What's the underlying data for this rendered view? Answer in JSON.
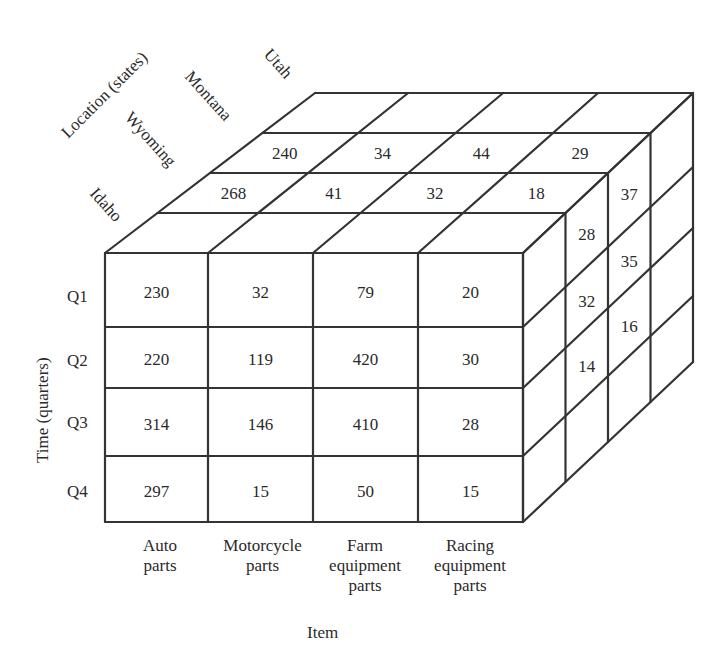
{
  "chart_data": {
    "type": "table",
    "axes": {
      "time": {
        "label": "Time (quarters)",
        "ticks": [
          "Q1",
          "Q2",
          "Q3",
          "Q4"
        ]
      },
      "item": {
        "label": "Item",
        "ticks": [
          "Auto parts",
          "Motorcycle parts",
          "Farm equipment parts",
          "Racing equipment parts"
        ]
      },
      "location": {
        "label": "Location (states)",
        "ticks": [
          "Idaho",
          "Wyoming",
          "Montana",
          "Utah"
        ]
      }
    },
    "front_face_idaho": {
      "rows": [
        "Q1",
        "Q2",
        "Q3",
        "Q4"
      ],
      "columns": [
        "Auto parts",
        "Motorcycle parts",
        "Farm equipment parts",
        "Racing equipment parts"
      ],
      "values": [
        [
          230,
          32,
          79,
          20
        ],
        [
          220,
          119,
          420,
          30
        ],
        [
          314,
          146,
          410,
          28
        ],
        [
          297,
          15,
          50,
          15
        ]
      ]
    },
    "top_face_q1": {
      "Wyoming": [
        268,
        41,
        32,
        18
      ],
      "Montana": [
        240,
        34,
        44,
        29
      ]
    },
    "right_face_racing_equipment": {
      "Wyoming": {
        "Q1": 28,
        "Q2": 32,
        "Q3": 14
      },
      "Montana": {
        "Q1": 37,
        "Q2": 35,
        "Q3": 16
      }
    }
  },
  "labels": {
    "location_title": "Location (states)",
    "states": [
      "Idaho",
      "Wyoming",
      "Montana",
      "Utah"
    ],
    "time_title": "Time (quarters)",
    "quarters": [
      "Q1",
      "Q2",
      "Q3",
      "Q4"
    ],
    "item_title": "Item",
    "items": [
      [
        "Auto",
        "parts"
      ],
      [
        "Motorcycle",
        "parts"
      ],
      [
        "Farm",
        "equipment",
        "parts"
      ],
      [
        "Racing",
        "equipment",
        "parts"
      ]
    ]
  },
  "front": [
    [
      "230",
      "32",
      "79",
      "20"
    ],
    [
      "220",
      "119",
      "420",
      "30"
    ],
    [
      "314",
      "146",
      "410",
      "28"
    ],
    [
      "297",
      "15",
      "50",
      "15"
    ]
  ],
  "top": {
    "wyoming": [
      "268",
      "41",
      "32",
      "18"
    ],
    "montana": [
      "240",
      "34",
      "44",
      "29"
    ]
  },
  "side": {
    "wyoming": [
      "28",
      "32",
      "14"
    ],
    "montana": [
      "37",
      "35",
      "16"
    ]
  }
}
